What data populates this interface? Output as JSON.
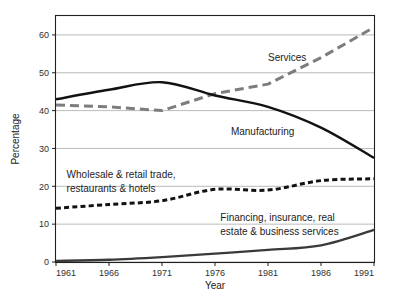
{
  "chart_data": {
    "type": "line",
    "title": "",
    "xlabel": "Year",
    "ylabel": "Percentage",
    "xlim": [
      1961,
      1991
    ],
    "ylim": [
      0,
      65
    ],
    "grid": true,
    "legend_position": "inline-annotations",
    "x_ticks": [
      "1961",
      "1966",
      "1971",
      "1976",
      "1981",
      "1986",
      "1991"
    ],
    "y_ticks": [
      "0",
      "10",
      "20",
      "30",
      "40",
      "50",
      "60"
    ],
    "x": [
      1961,
      1966,
      1971,
      1976,
      1981,
      1986,
      1991
    ],
    "series": [
      {
        "name": "Services",
        "label": "Services",
        "color": "#7d7d7d",
        "style": "dashed",
        "values": [
          41.5,
          41.0,
          40.0,
          44.5,
          47.0,
          54.0,
          62.0
        ]
      },
      {
        "name": "Manufacturing",
        "label": "Manufacturing",
        "color": "#121212",
        "style": "solid",
        "values": [
          43.0,
          45.5,
          47.5,
          44.0,
          41.0,
          35.5,
          27.5
        ]
      },
      {
        "name": "Wholesale & retail trade, restaurants & hotels",
        "label": "Wholesale & retail trade,\nrestaurants & hotels",
        "label_line1": "Wholesale & retail trade,",
        "label_line2": "restaurants & hotels",
        "color": "#121212",
        "style": "dotted",
        "values": [
          14.2,
          15.2,
          16.2,
          19.2,
          19.0,
          21.5,
          22.0
        ]
      },
      {
        "name": "Financing, insurance, real estate & business services",
        "label": "Financing, insurance, real\nestate & business services",
        "label_line1": "Financing, insurance, real",
        "label_line2": "estate & business services",
        "color": "#3a3a3a",
        "style": "solid",
        "values": [
          0.3,
          0.6,
          1.3,
          2.2,
          3.2,
          4.4,
          8.5
        ]
      }
    ],
    "annotations": [
      {
        "text": "Services",
        "x": 1981,
        "y": 53
      },
      {
        "text": "Manufacturing",
        "x": 1977.5,
        "y": 33.5
      },
      {
        "text": "Wholesale & retail trade,",
        "x": 1962,
        "y": 22.2
      },
      {
        "text": "restaurants & hotels",
        "x": 1962,
        "y": 18.6
      },
      {
        "text": "Financing, insurance, real",
        "x": 1976.5,
        "y": 10.8
      },
      {
        "text": "estate & business services",
        "x": 1976.5,
        "y": 7.2
      }
    ]
  },
  "colors": {
    "background": "#ffffff",
    "axis": "#202020",
    "grid": "#a8a8a8",
    "services": "#7d7d7d",
    "manufacturing": "#121212",
    "wholesale": "#121212",
    "financing": "#3a3a3a"
  }
}
